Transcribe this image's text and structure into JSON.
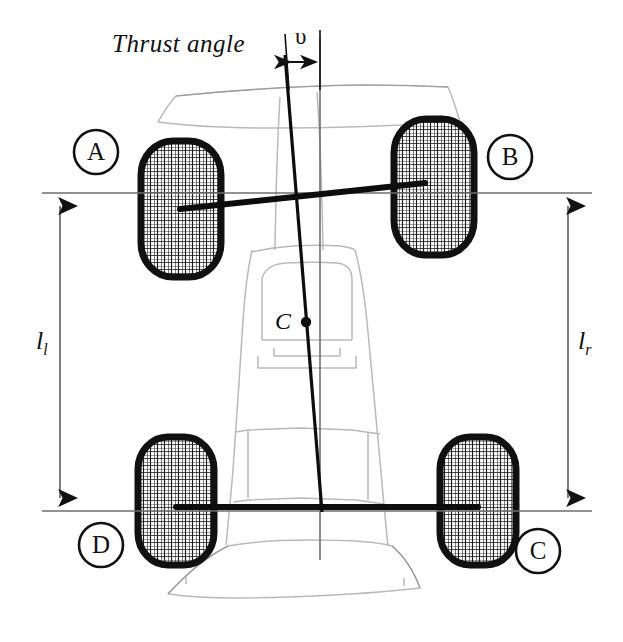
{
  "figure": {
    "domain_kind": "technical-diagram",
    "title_label": "Thrust angle",
    "angle_symbol": "υ",
    "center_label": "C",
    "dimension_left": {
      "base": "l",
      "sub": "l",
      "full": "lₗ"
    },
    "dimension_right": {
      "base": "l",
      "sub": "r",
      "full": "lᵣ"
    },
    "wheel_markers": [
      {
        "id": "A",
        "label": "A",
        "position": "front-left"
      },
      {
        "id": "B",
        "label": "B",
        "position": "front-right"
      },
      {
        "id": "C",
        "label": "C",
        "position": "rear-right"
      },
      {
        "id": "D",
        "label": "D",
        "position": "rear-left"
      }
    ],
    "colors": {
      "ink": "#111111",
      "body_outline": "#b9b9b9",
      "body_outline_dark": "#8d8d8d",
      "axis_line": "#6e6e6e",
      "background": "#ffffff"
    },
    "elements": {
      "front_axle": "front-axle-line",
      "rear_axle": "rear-axle-line",
      "thrust_line": "thrust-center-line",
      "geometric_centerline": "geometric-centerline",
      "left_dimension": "left-track-dimension",
      "right_dimension": "right-track-dimension",
      "center_of_gravity": "center-of-gravity-dot"
    }
  }
}
